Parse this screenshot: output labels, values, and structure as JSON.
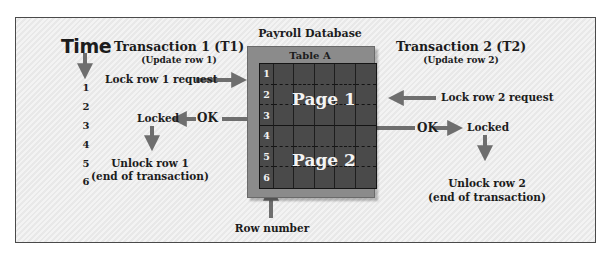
{
  "diagram": {
    "time": {
      "title": "Time",
      "ticks": [
        "1",
        "2",
        "3",
        "4",
        "5",
        "6"
      ]
    },
    "database": {
      "title": "Payroll Database",
      "table_title": "Table A",
      "rows": [
        "1",
        "2",
        "3",
        "4",
        "5",
        "6"
      ],
      "data_columns": 5,
      "pages": [
        {
          "label": "Page 1",
          "rows": [
            "1",
            "2",
            "3"
          ]
        },
        {
          "label": "Page 2",
          "rows": [
            "4",
            "5",
            "6"
          ]
        }
      ],
      "row_number_caption": "Row number"
    },
    "transaction1": {
      "title": "Transaction 1 (T1)",
      "subtitle": "(Update row 1)",
      "request": "Lock row 1 request",
      "ok": "OK",
      "locked": "Locked",
      "unlock_line1": "Unlock row 1",
      "unlock_line2": "(end of transaction)"
    },
    "transaction2": {
      "title": "Transaction 2 (T2)",
      "subtitle": "(Update row 2)",
      "request": "Lock row 2 request",
      "ok": "OK",
      "locked": "Locked",
      "unlock_line1": "Unlock row 2",
      "unlock_line2": "(end of transaction)"
    },
    "colors": {
      "arrow": "#6e6e6e",
      "frame_bg": "#ededed",
      "table_outer": "#8b8b8b",
      "table_grid": "#4a4a4a"
    }
  }
}
